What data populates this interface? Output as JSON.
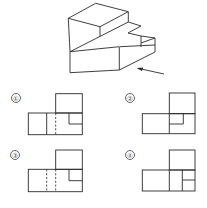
{
  "figure": {
    "type": "orthographic-projection-question",
    "view_arrow": "arrow-pointing-to-front-right-face"
  },
  "options": [
    {
      "label": "①",
      "description": "left rect split by solid line, dashed line, small notch rect at top-right of bottom"
    },
    {
      "label": "②",
      "description": "left rect with solid vertical at top box edge, small notch rect below top box"
    },
    {
      "label": "③",
      "description": "two dashed verticals, small notch rect at top-right of bottom"
    },
    {
      "label": "④",
      "description": "solid verticals, right column split horizontally"
    }
  ],
  "colors": {
    "line": "#2a2a2a",
    "label": "#555555"
  }
}
